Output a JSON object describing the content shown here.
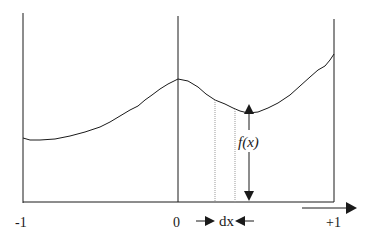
{
  "diagram": {
    "type": "function-integral-illustration",
    "x_labels": {
      "left": "-1",
      "center": "0",
      "right": "+1"
    },
    "function_label": "f(x)",
    "width_label": "dx",
    "colors": {
      "line": "#1a1a1a",
      "dotted": "#999999",
      "background": "#ffffff"
    },
    "curve_points": [
      [
        23,
        138
      ],
      [
        30,
        140
      ],
      [
        40,
        140
      ],
      [
        55,
        139
      ],
      [
        70,
        136
      ],
      [
        85,
        132
      ],
      [
        100,
        127
      ],
      [
        110,
        122
      ],
      [
        120,
        116
      ],
      [
        130,
        110
      ],
      [
        138,
        106
      ],
      [
        145,
        100
      ],
      [
        152,
        95
      ],
      [
        160,
        89
      ],
      [
        168,
        84
      ],
      [
        178,
        79
      ],
      [
        188,
        81
      ],
      [
        198,
        87
      ],
      [
        206,
        94
      ],
      [
        215,
        100
      ],
      [
        225,
        104
      ],
      [
        233,
        108
      ],
      [
        240,
        111
      ],
      [
        248,
        113
      ],
      [
        258,
        112
      ],
      [
        268,
        108
      ],
      [
        278,
        103
      ],
      [
        290,
        95
      ],
      [
        300,
        86
      ],
      [
        310,
        77
      ],
      [
        318,
        70
      ],
      [
        325,
        66
      ],
      [
        330,
        60
      ],
      [
        334,
        54
      ]
    ]
  }
}
